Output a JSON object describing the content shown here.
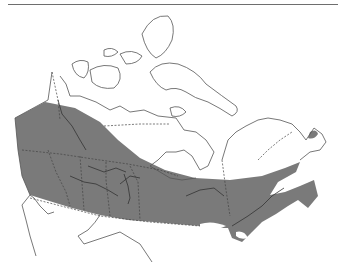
{
  "map": {
    "subject": "Canada range map",
    "legend": [],
    "colors": {
      "background": "#ffffff",
      "range_fill": "#7a7a7a",
      "outline": "#555555",
      "top_rule": "#6e6e6e"
    },
    "regions": [
      {
        "name": "range-band",
        "description": "Shaded distribution band across southern/boreal Canada from British Columbia to Newfoundland"
      },
      {
        "name": "arctic-archipelago",
        "description": "Unshaded northern islands"
      },
      {
        "name": "hudson-bay",
        "description": "Unshaded bay"
      },
      {
        "name": "great-lakes",
        "description": "Unshaded southern lakes"
      }
    ]
  }
}
